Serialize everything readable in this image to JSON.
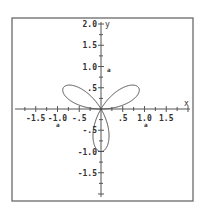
{
  "chart_data": {
    "type": "line",
    "title": "",
    "equation": "r = sin(3θ)",
    "xlabel": "x",
    "ylabel": "y",
    "xlim": [
      -1.95,
      2.0
    ],
    "ylim": [
      -2.0,
      2.0
    ],
    "grid": false,
    "x_ticks": [
      {
        "value": -1.5,
        "label": "-1.5"
      },
      {
        "value": -1.0,
        "label": "-1.0"
      },
      {
        "value": -0.5,
        "label": "-.5"
      },
      {
        "value": 0.5,
        "label": ".5"
      },
      {
        "value": 1.0,
        "label": "1.0"
      },
      {
        "value": 1.5,
        "label": "1.5"
      }
    ],
    "y_ticks": [
      {
        "value": 2.0,
        "label": "2.0"
      },
      {
        "value": 1.5,
        "label": "1.5"
      },
      {
        "value": 1.0,
        "label": "1.0"
      },
      {
        "value": 0.5,
        "label": ".5"
      },
      {
        "value": -0.5,
        "label": "-.5"
      },
      {
        "value": -1.0,
        "label": "-1.0"
      },
      {
        "value": -1.5,
        "label": "-1.5"
      }
    ],
    "annotations": [
      {
        "text": "a",
        "x": 1.0,
        "y": -0.3
      },
      {
        "text": "a",
        "x": -1.0,
        "y": -0.3
      },
      {
        "text": "a",
        "x": 0.1,
        "y": 1.0
      }
    ],
    "series": [
      {
        "name": "three-leaf rose",
        "petal_tips": [
          [
            0.866,
            0.5
          ],
          [
            -0.866,
            0.5
          ],
          [
            0,
            -1.0
          ]
        ]
      }
    ]
  },
  "labels": {
    "x_axis": "x",
    "y_axis": "y",
    "mark": "a"
  },
  "style": {
    "curve_color": "#4a4a4a",
    "frame_color": "#6a6a6a"
  }
}
